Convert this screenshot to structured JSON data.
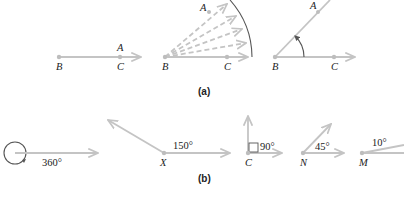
{
  "panel_a": {
    "caption": "(a)",
    "figure1": {
      "labels": {
        "A": "A",
        "B": "B",
        "C": "C"
      }
    },
    "figure2": {
      "labels": {
        "A": "A",
        "B": "B",
        "C": "C"
      }
    },
    "figure3": {
      "labels": {
        "A": "A",
        "B": "B",
        "C": "C"
      }
    }
  },
  "panel_b": {
    "caption": "(b)",
    "angles": [
      {
        "degrees": "360°",
        "vertex": ""
      },
      {
        "degrees": "150°",
        "vertex": "X"
      },
      {
        "degrees": "90°",
        "vertex": "C"
      },
      {
        "degrees": "45°",
        "vertex": "N"
      },
      {
        "degrees": "10°",
        "vertex": "M"
      }
    ]
  },
  "colors": {
    "ray": "#c4c4c4",
    "arc": "#555555",
    "text": "#222222"
  }
}
